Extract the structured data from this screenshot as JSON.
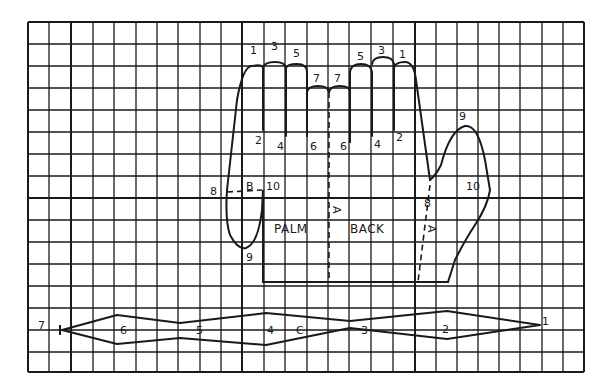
{
  "diagram": {
    "kind": "glove pattern on grid",
    "colors": {
      "ink": "#1a1a1a",
      "paper": "#ffffff"
    },
    "grid": {
      "x_lines": [
        28,
        49,
        71,
        93,
        114,
        136,
        157,
        178,
        200,
        221,
        242,
        264,
        285,
        307,
        328,
        349,
        371,
        393,
        415,
        436,
        457,
        478,
        499,
        520,
        542,
        563,
        584
      ],
      "y_lines": [
        22,
        44,
        66,
        88,
        110,
        132,
        154,
        176,
        198,
        220,
        242,
        264,
        286,
        308,
        330,
        352,
        372
      ],
      "heavy_x": [
        71,
        242,
        415
      ],
      "heavy_y": [
        198
      ]
    },
    "hand_labels": {
      "left_fingertips": [
        "1",
        "3",
        "5"
      ],
      "center_fingertips": [
        "7",
        "7"
      ],
      "right_fingertips": [
        "5",
        "3",
        "1"
      ],
      "left_finger_bases": [
        "2",
        "4",
        "6"
      ],
      "right_finger_bases": [
        "6",
        "4",
        "2"
      ],
      "palm": "PALM",
      "back": "BACK",
      "fold_marker": "A",
      "thumb_tip": "9",
      "thumb_notch": "10",
      "thumb_base": "8",
      "gusset_label": "B",
      "gusset_left_point": "8",
      "gusset_right_point": "10",
      "gusset_bottom": "9"
    },
    "strip": {
      "label": "C",
      "points": [
        "7",
        "6",
        "5",
        "4",
        "3",
        "2",
        "1"
      ]
    }
  }
}
